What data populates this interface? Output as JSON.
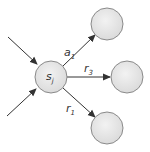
{
  "diagram": {
    "type": "state-transition-graph",
    "colors": {
      "node_fill": "#e6e6e6",
      "node_stroke": "#8a8a8a",
      "edge": "#333333"
    },
    "nodes": [
      {
        "id": "s_j",
        "label": "s",
        "subscript": "j",
        "cx": 51,
        "cy": 77,
        "r": 16
      },
      {
        "id": "top",
        "label": "",
        "cx": 107,
        "cy": 24,
        "r": 16
      },
      {
        "id": "middle",
        "label": "",
        "cx": 127,
        "cy": 77,
        "r": 16
      },
      {
        "id": "bottom",
        "label": "",
        "cx": 107,
        "cy": 128,
        "r": 16
      }
    ],
    "incoming_edges": [
      {
        "from": [
          8,
          37
        ],
        "to": [
          37,
          64
        ]
      },
      {
        "from": [
          7,
          116
        ],
        "to": [
          36,
          89
        ]
      }
    ],
    "outgoing_edges": [
      {
        "from": "s_j",
        "to": "top",
        "label": "a",
        "subscript": "1",
        "label_pos": [
          64,
          56
        ]
      },
      {
        "from": "s_j",
        "to": "middle",
        "label": "r",
        "subscript": "3",
        "label_pos": [
          84,
          72
        ]
      },
      {
        "from": "s_j",
        "to": "bottom",
        "label": "r",
        "subscript": "1",
        "label_pos": [
          66,
          112
        ]
      }
    ]
  }
}
